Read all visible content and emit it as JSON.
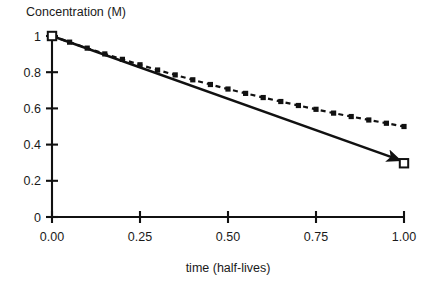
{
  "chart_data": {
    "type": "line",
    "title": "",
    "xlabel": "time (half-lives)",
    "ylabel": "Concentration (M)",
    "xlim": [
      0.0,
      1.0
    ],
    "ylim": [
      0.0,
      1.0
    ],
    "grid": false,
    "legend_position": "none",
    "xticks": [
      0.0,
      0.25,
      0.5,
      0.75,
      1.0
    ],
    "xtick_labels": [
      "0.00",
      "0.25",
      "0.50",
      "0.75",
      "1.00"
    ],
    "yticks": [
      0.0,
      0.2,
      0.4,
      0.6,
      0.8,
      1.0
    ],
    "ytick_labels": [
      "0",
      "0.2",
      "0.4",
      "0.6",
      "0.8",
      "1"
    ],
    "series": [
      {
        "name": "exponential-decay",
        "style": "dashed",
        "marker": "filled-square",
        "color": "#111111",
        "x": [
          0.0,
          0.05,
          0.1,
          0.15,
          0.2,
          0.25,
          0.3,
          0.35,
          0.4,
          0.45,
          0.5,
          0.55,
          0.6,
          0.65,
          0.7,
          0.75,
          0.8,
          0.85,
          0.9,
          0.95,
          1.0
        ],
        "values": [
          1.0,
          0.966,
          0.933,
          0.901,
          0.871,
          0.841,
          0.812,
          0.785,
          0.758,
          0.732,
          0.707,
          0.683,
          0.66,
          0.638,
          0.616,
          0.595,
          0.574,
          0.555,
          0.536,
          0.518,
          0.5
        ]
      },
      {
        "name": "linear-extrapolation",
        "style": "solid",
        "marker": "open-square-endpoints",
        "arrow": true,
        "color": "#111111",
        "x": [
          0.0,
          1.0
        ],
        "values": [
          1.0,
          0.297
        ]
      }
    ],
    "annotations": [
      {
        "name": "start-open-square",
        "x": 0.0,
        "y": 1.0
      },
      {
        "name": "end-open-square",
        "x": 1.0,
        "y": 0.297
      },
      {
        "name": "arrowhead",
        "x": 0.97,
        "y": 0.32
      }
    ]
  },
  "axes": {
    "y_title": "Concentration (M)",
    "x_title": "time (half-lives)"
  }
}
